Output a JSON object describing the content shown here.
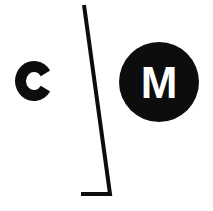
{
  "canvas": {
    "width": 213,
    "height": 211,
    "background_color": "#ffffff",
    "ink_color": "#0d0d0d"
  },
  "logo": {
    "name": "c-slash-m-logo",
    "description": "Minimalist monogram mark",
    "wordmark_reading": "C | M",
    "elements": {
      "letter_c": {
        "glyph": "C",
        "color": "#0d0d0d",
        "cx": 34,
        "cy": 81,
        "outer_rx": 19,
        "outer_ry": 20,
        "stroke_width": 11
      },
      "divider_stroke": {
        "icon_name": "diagonal-corner-stroke",
        "color": "#0d0d0d",
        "top_x": 84,
        "top_y": 5,
        "bottom_x": 110,
        "bottom_y": 194,
        "foot_x": 81,
        "foot_y": 194,
        "thickness": 4
      },
      "circle_badge": {
        "fill": "#0d0d0d",
        "cx": 159,
        "cy": 82,
        "r": 40,
        "glyph": "M",
        "glyph_color": "#ffffff"
      }
    }
  }
}
